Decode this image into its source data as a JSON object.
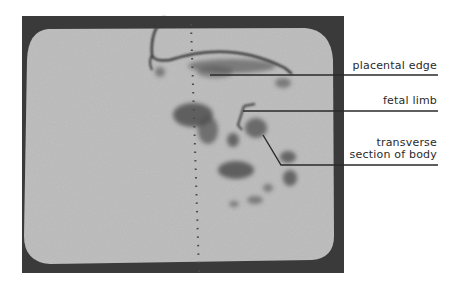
{
  "figure": {
    "type": "ultrasound scan photograph of monitor screen",
    "colors": {
      "background": "#ffffff",
      "bezel": "#3a3a3a",
      "screen": "#bdbdbd",
      "echo_dark": "#4a4a4a",
      "leader_line": "#2a2a2a"
    },
    "labels": [
      {
        "text": "placental edge"
      },
      {
        "text": "fetal limb"
      },
      {
        "text_line1": "transverse",
        "text_line2": "section of body"
      }
    ]
  }
}
